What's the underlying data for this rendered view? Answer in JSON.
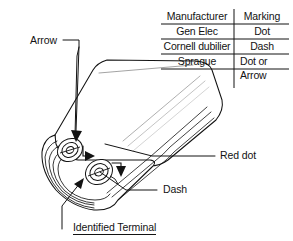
{
  "diagram": {
    "line_color": "#131313",
    "body_fill": "#ffffff",
    "background": "#ffffff"
  },
  "table": {
    "headers": {
      "manufacturer": "Manufacturer",
      "marking": "Marking"
    },
    "rows": [
      {
        "manufacturer": "Gen Elec",
        "marking": "Dot"
      },
      {
        "manufacturer": "Cornell dubilier",
        "marking": "Dash"
      },
      {
        "manufacturer": "Sprague",
        "marking_line1": "Dot or",
        "marking_line2": "Arrow"
      }
    ]
  },
  "callouts": {
    "arrow": "Arrow",
    "red_dot": "Red dot",
    "dash": "Dash",
    "identified_terminal": "Identified Terminal"
  }
}
